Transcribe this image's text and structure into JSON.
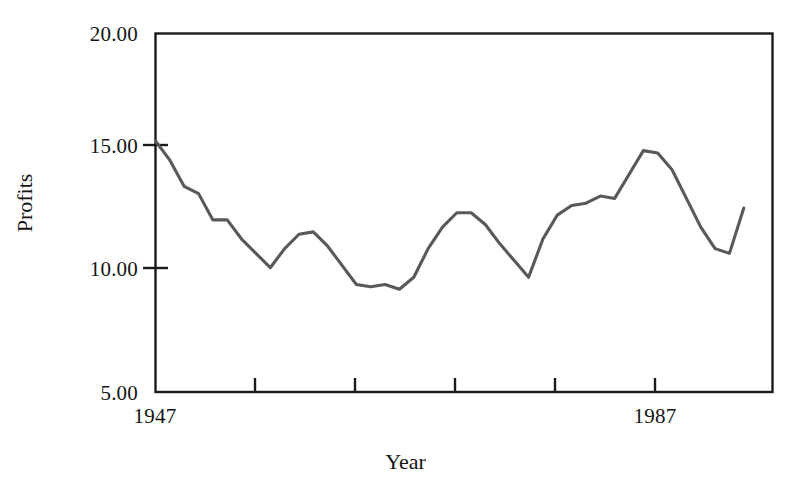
{
  "chart_data": {
    "type": "line",
    "title": "",
    "xlabel": "Year",
    "ylabel": "Profits",
    "xlim": [
      1947,
      1990
    ],
    "ylim": [
      5.0,
      20.0
    ],
    "grid": false,
    "legend": null,
    "y_ticks": [
      20.0,
      15.0,
      10.0,
      5.0
    ],
    "y_tick_labels": [
      "20.00",
      "15.00",
      "10.00",
      "5.00"
    ],
    "x_ticks": [
      1947,
      1955,
      1963,
      1971,
      1979,
      1987
    ],
    "x_tick_labels": [
      "1947",
      "",
      "",
      "",
      "",
      "1987"
    ],
    "line_color": "#595959",
    "line_width": 3.1,
    "series": [
      {
        "name": "Profits",
        "x": [
          1947,
          1948,
          1949,
          1950,
          1951,
          1952,
          1953,
          1954,
          1955,
          1956,
          1957,
          1958,
          1959,
          1960,
          1961,
          1962,
          1963,
          1964,
          1965,
          1966,
          1967,
          1968,
          1969,
          1970,
          1971,
          1972,
          1973,
          1974,
          1975,
          1976,
          1977,
          1978,
          1979,
          1980,
          1981,
          1982,
          1983,
          1984,
          1985,
          1986,
          1987,
          1988
        ],
        "y": [
          15.5,
          14.7,
          13.6,
          13.3,
          12.2,
          12.2,
          11.4,
          10.8,
          10.2,
          11.0,
          11.6,
          11.7,
          11.1,
          10.3,
          9.5,
          9.4,
          9.5,
          9.3,
          9.8,
          11.0,
          11.9,
          12.5,
          12.5,
          12.0,
          11.2,
          10.5,
          9.8,
          11.4,
          12.4,
          12.8,
          12.9,
          13.2,
          13.1,
          14.1,
          15.1,
          15.0,
          14.3,
          13.1,
          11.9,
          11.0,
          10.8,
          12.7
        ]
      }
    ]
  },
  "axes": {
    "y_tick_labels": [
      "20.00",
      "15.00",
      "10.00",
      "5.00"
    ],
    "x_tick_labels": [
      "1947",
      "1987"
    ],
    "x_title": "Year",
    "y_title": "Profits"
  }
}
